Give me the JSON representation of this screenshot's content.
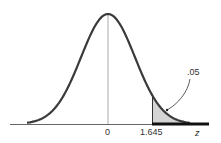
{
  "chart_data": {
    "type": "area",
    "title": "",
    "xlabel": "z",
    "ylabel": "",
    "tick_labels": [
      "0",
      "1.645"
    ],
    "critical_value": 1.645,
    "shaded_tail_area": 0.05,
    "annotation": ".05",
    "rejection_region": {
      "from": 1.645,
      "to": "infinity"
    },
    "colors": {
      "curve": "#333333",
      "shade": "#d0d0d0",
      "axis": "#555555"
    }
  },
  "labels": {
    "zero": "0",
    "critical": "1.645",
    "axis": "z",
    "area": ".05"
  }
}
